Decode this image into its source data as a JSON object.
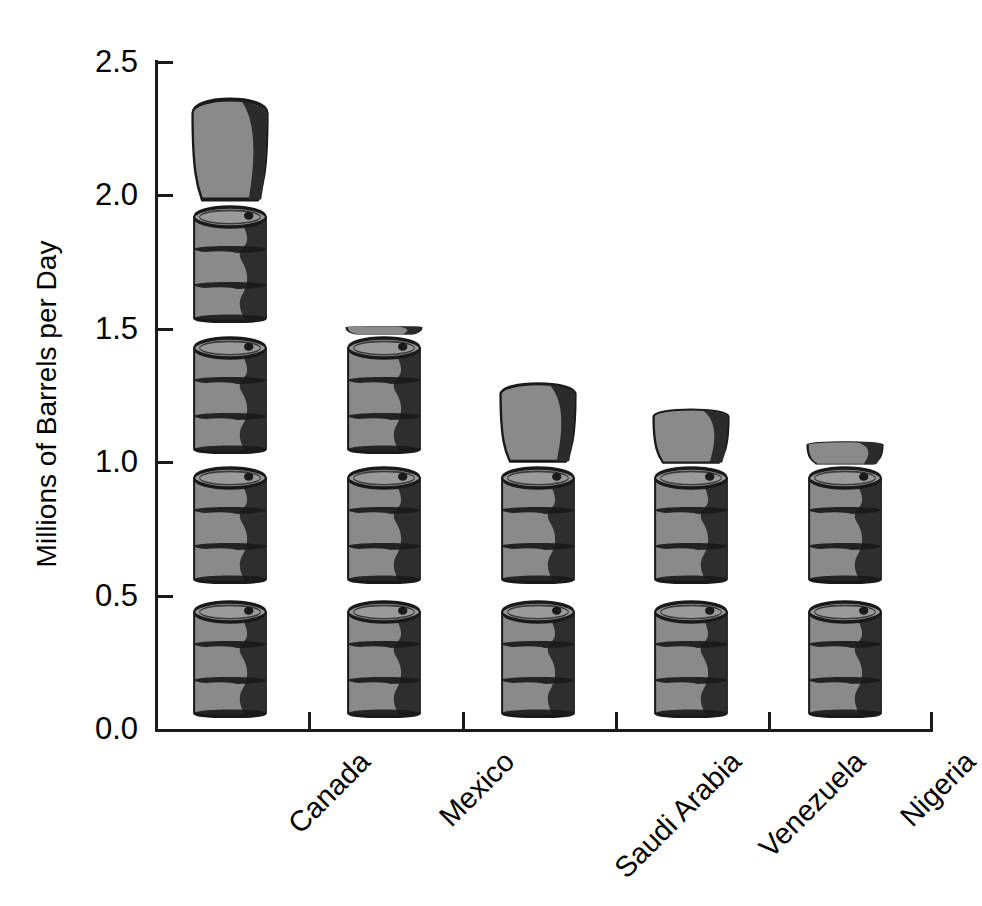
{
  "chart_data": {
    "type": "bar",
    "title": "",
    "subtitle": "",
    "xlabel": "",
    "ylabel": "Millions of Barrels per Day",
    "categories": [
      "Canada",
      "Mexico",
      "Saudi Arabia",
      "Venezuela",
      "Nigeria"
    ],
    "values": [
      2.49,
      1.54,
      1.38,
      1.26,
      1.11
    ],
    "ylim": [
      0.0,
      2.5
    ],
    "ytick_labels": [
      "0.0",
      "0.5",
      "1.0",
      "1.5",
      "2.0",
      "2.5"
    ],
    "ytick_values": [
      0.0,
      0.5,
      1.0,
      1.5,
      2.0,
      2.5
    ],
    "grid": false,
    "legend": null,
    "legend_position": "none",
    "annotations": [],
    "glyph": "oil-barrel",
    "glyph_unit_value": 0.5
  },
  "axis": {
    "y_title": "Millions of Barrels per Day",
    "ticks": [
      {
        "label": "2.5",
        "value": 2.5
      },
      {
        "label": "2.0",
        "value": 2.0
      },
      {
        "label": "1.5",
        "value": 1.5
      },
      {
        "label": "1.0",
        "value": 1.0
      },
      {
        "label": "0.5",
        "value": 0.5
      },
      {
        "label": "0.0",
        "value": 0.0
      }
    ]
  },
  "colors": {
    "barrel_body": "#8a8a8a",
    "barrel_shadow": "#2b2b2b",
    "barrel_top": "#9a9a9a",
    "outline": "#1a1a1a",
    "axis": "#1a1a1a",
    "background": "#ffffff"
  },
  "series": [
    {
      "category": "Canada",
      "value": 2.49
    },
    {
      "category": "Mexico",
      "value": 1.54
    },
    {
      "category": "Saudi Arabia",
      "value": 1.38
    },
    {
      "category": "Venezuela",
      "value": 1.26
    },
    {
      "category": "Nigeria",
      "value": 1.11
    }
  ]
}
